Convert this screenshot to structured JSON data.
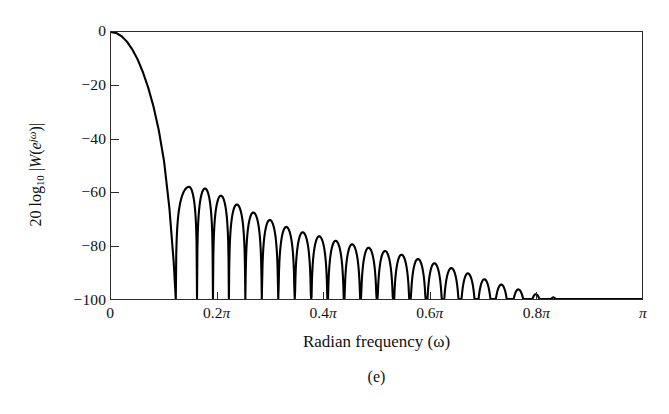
{
  "figure": {
    "caption": "(e)",
    "background_color": "#ffffff",
    "axis_color": "#2b2b2b",
    "curve_color": "#000000"
  },
  "axes": {
    "y_title_parts": {
      "prefix": "20 log",
      "log_base": "10",
      "bar_open": " |",
      "w": "W",
      "paren_open": "(",
      "e": "e",
      "exponent": "jω",
      "paren_close": ")",
      "bar_close": "|"
    },
    "x_title": "Radian frequency (ω)",
    "y_ticks": [
      {
        "value": 0,
        "label": "0"
      },
      {
        "value": -20,
        "label": "−20"
      },
      {
        "value": -40,
        "label": "−40"
      },
      {
        "value": -60,
        "label": "−60"
      },
      {
        "value": -80,
        "label": "−80"
      },
      {
        "value": -100,
        "label": "−100"
      }
    ],
    "x_ticks": [
      {
        "value": 0.0,
        "label": "0"
      },
      {
        "value": 0.2,
        "label": "0.2π"
      },
      {
        "value": 0.4,
        "label": "0.4π"
      },
      {
        "value": 0.6,
        "label": "0.6π"
      },
      {
        "value": 0.8,
        "label": "0.8π"
      },
      {
        "value": 1.0,
        "label": "π"
      }
    ]
  },
  "chart_data": {
    "type": "line",
    "title": "",
    "subtitle": "",
    "xlabel": "Radian frequency (ω)",
    "ylabel": "20 log10 |W(e^jω)|",
    "xlim": [
      0,
      1
    ],
    "ylim": [
      -100,
      0
    ],
    "x_unit": "π radians/sample",
    "grid": false,
    "legend": null,
    "xtick_values": [
      0,
      0.2,
      0.4,
      0.6,
      0.8,
      1.0
    ],
    "xtick_labels": [
      "0",
      "0.2π",
      "0.4π",
      "0.6π",
      "0.8π",
      "π"
    ],
    "ytick_values": [
      0,
      -20,
      -40,
      -60,
      -80,
      -100
    ],
    "ytick_labels": [
      "0",
      "−20",
      "−40",
      "−60",
      "−80",
      "−100"
    ],
    "main_lobe": {
      "peak_x": 0.0,
      "peak_y": 0.0,
      "first_null_x": 0.122,
      "null_floor_y": -100
    },
    "sidelobe_peaks_x": [
      0.147,
      0.177,
      0.207,
      0.237,
      0.268,
      0.299,
      0.33,
      0.361,
      0.392,
      0.423,
      0.454,
      0.485,
      0.516,
      0.547,
      0.578,
      0.609,
      0.641,
      0.672,
      0.703,
      0.735,
      0.767,
      0.8,
      0.833
    ],
    "sidelobe_peaks_y": [
      -58.0,
      -58.6,
      -61.3,
      -64.6,
      -67.6,
      -70.4,
      -73.0,
      -75.0,
      -76.5,
      -78.2,
      -79.5,
      -80.8,
      -82.0,
      -83.4,
      -85.0,
      -86.6,
      -88.4,
      -90.4,
      -92.6,
      -94.6,
      -96.4,
      -98.2,
      -99.4
    ],
    "null_positions_x": [
      0.122,
      0.162,
      0.192,
      0.222,
      0.253,
      0.284,
      0.315,
      0.346,
      0.377,
      0.408,
      0.439,
      0.47,
      0.501,
      0.532,
      0.563,
      0.594,
      0.625,
      0.657,
      0.688,
      0.719,
      0.751,
      0.784,
      0.817,
      0.85
    ],
    "series": [
      {
        "name": "20 log10 |W(e^jω)|",
        "color": "#000000",
        "linewidth": 2.0,
        "x": [
          0.0,
          0.01,
          0.02,
          0.03,
          0.04,
          0.05,
          0.06,
          0.07,
          0.08,
          0.09,
          0.1,
          0.11,
          0.118,
          0.122,
          0.147,
          0.162,
          0.177,
          0.192,
          0.207,
          0.222,
          0.237,
          0.253,
          0.268,
          0.284,
          0.299,
          0.315,
          0.33,
          0.346,
          0.361,
          0.377,
          0.392,
          0.408,
          0.423,
          0.439,
          0.454,
          0.47,
          0.485,
          0.501,
          0.516,
          0.532,
          0.547,
          0.563,
          0.578,
          0.594,
          0.609,
          0.625,
          0.641,
          0.657,
          0.672,
          0.688,
          0.703,
          0.719,
          0.735,
          0.751,
          0.767,
          0.784,
          0.8,
          0.817,
          0.833,
          0.85,
          1.0
        ],
        "y": [
          0.0,
          -0.4,
          -1.6,
          -3.6,
          -6.5,
          -10.2,
          -15.0,
          -20.8,
          -27.9,
          -36.8,
          -48.5,
          -66.0,
          -86.0,
          -100.0,
          -58.0,
          -100.0,
          -58.6,
          -100.0,
          -61.3,
          -100.0,
          -64.6,
          -100.0,
          -67.6,
          -100.0,
          -70.4,
          -100.0,
          -73.0,
          -100.0,
          -75.0,
          -100.0,
          -76.5,
          -100.0,
          -78.2,
          -100.0,
          -79.5,
          -100.0,
          -80.8,
          -100.0,
          -82.0,
          -100.0,
          -83.4,
          -100.0,
          -85.0,
          -100.0,
          -86.6,
          -100.0,
          -88.4,
          -100.0,
          -90.4,
          -100.0,
          -92.6,
          -100.0,
          -94.6,
          -100.0,
          -96.4,
          -100.0,
          -98.2,
          -100.0,
          -99.4,
          -100.0,
          -100.0
        ]
      }
    ]
  }
}
